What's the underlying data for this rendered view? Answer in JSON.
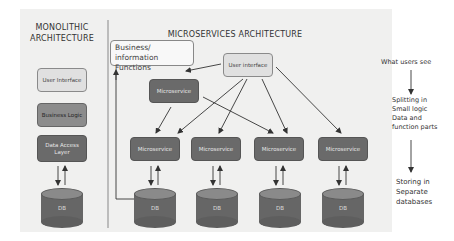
{
  "monolithic": {
    "title_line1": "MONOLITHIC",
    "title_line2": "ARCHITECTURE",
    "layers": [
      {
        "label": "User Interface",
        "shade": "light"
      },
      {
        "label": "Business Logic",
        "shade": "mid"
      },
      {
        "label": "Data Access Layer",
        "shade": "dark"
      }
    ],
    "db_label": "DB"
  },
  "microservices": {
    "title": "MICROSERVICES ARCHITECTURE",
    "business_box_line1": "Business/ information",
    "business_box_line2": "Functions",
    "user_interface": "User interface",
    "middle_service": "Microservice",
    "services": [
      "Microservice",
      "Microservice",
      "Microservice",
      "Microservice"
    ],
    "dbs": [
      "DB",
      "DB",
      "DB",
      "DB"
    ]
  },
  "side_notes": {
    "step1": "What users see",
    "step2_lines": [
      "Splitting in",
      "Small logic",
      "Data and",
      "function parts"
    ],
    "step3_lines": [
      "Storing in",
      "Separate",
      "databases"
    ]
  },
  "colors": {
    "panel": "#f0f0ef",
    "light_box": "#e0e0e0",
    "mid_box": "#8c8c8c",
    "dark_box": "#6a6a6a",
    "line": "#333333"
  }
}
